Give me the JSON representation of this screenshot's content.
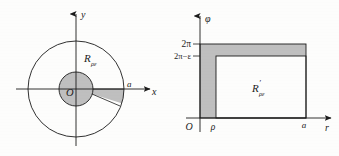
{
  "figure": {
    "caption": "",
    "background_color": "#fdfdfc",
    "stroke_color": "#1b1b1b",
    "shade_color": "#bfbfbf",
    "panels": [
      {
        "id": "cartesian-disk-panel",
        "name": "Cartesian xy disk with annulus and wedge",
        "axes": {
          "x_label": "x",
          "y_label": "y",
          "origin_label": "O"
        },
        "region_label": "R",
        "region_label_sub": "ρε",
        "region_label_prime": "",
        "radius_label": "a",
        "shapes": [
          {
            "type": "circle",
            "name": "outer-circle",
            "radius_label": "a",
            "filled": false
          },
          {
            "type": "circle",
            "name": "inner-circle",
            "radius_label": "ρ",
            "filled": true
          },
          {
            "type": "sector",
            "name": "cut-wedge",
            "filled": true
          }
        ]
      },
      {
        "id": "polar-rectangle-panel",
        "name": "Polar r-phi rectangle domain",
        "axes": {
          "x_label": "r",
          "y_label": "φ",
          "origin_label": "O"
        },
        "region_label": "R",
        "region_label_sub": "ρε",
        "region_label_prime": "′",
        "x_ticks": [
          {
            "label": "ρ",
            "name": "tick-rho"
          },
          {
            "label": "a",
            "name": "tick-a"
          }
        ],
        "y_ticks": [
          {
            "label": "2π",
            "name": "tick-two-pi"
          },
          {
            "label": "2π−ε",
            "name": "tick-two-pi-minus-eps"
          }
        ],
        "shapes": [
          {
            "type": "rect",
            "name": "main-rectangle",
            "filled": false
          },
          {
            "type": "rect",
            "name": "left-shaded-strip",
            "filled": true
          },
          {
            "type": "rect",
            "name": "top-shaded-strip",
            "filled": true
          }
        ]
      }
    ]
  }
}
